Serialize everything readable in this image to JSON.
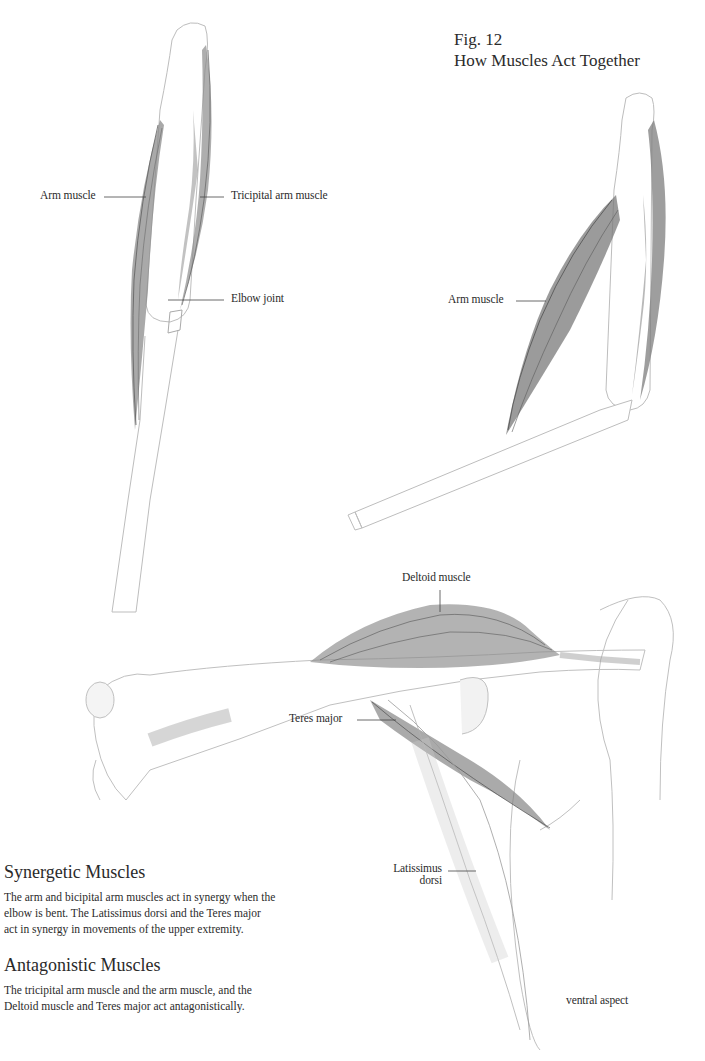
{
  "figure": {
    "number": "Fig. 12",
    "title": "How Muscles Act Together"
  },
  "illustrations": {
    "straight_arm": {
      "labels": {
        "arm_muscle": "Arm muscle",
        "tricipital": "Tricipital arm muscle",
        "elbow_joint": "Elbow joint"
      }
    },
    "bent_arm": {
      "labels": {
        "arm_muscle": "Arm muscle"
      }
    },
    "shoulder": {
      "labels": {
        "deltoid": "Deltoid muscle",
        "teres_major": "Teres major",
        "latissimus_line1": "Latissimus",
        "latissimus_line2": "dorsi"
      },
      "caption": "ventral aspect"
    }
  },
  "sections": [
    {
      "heading": "Synergetic Muscles",
      "lines": [
        "The arm and bicipital arm muscles act in synergy when the",
        "elbow is bent. The Latissimus dorsi and the Teres major",
        "act in synergy in movements of the upper extremity."
      ]
    },
    {
      "heading": "Antagonistic Muscles",
      "lines": [
        "The tricipital arm muscle and the arm muscle, and the",
        "Deltoid muscle and Teres major act antagonistically."
      ]
    }
  ]
}
